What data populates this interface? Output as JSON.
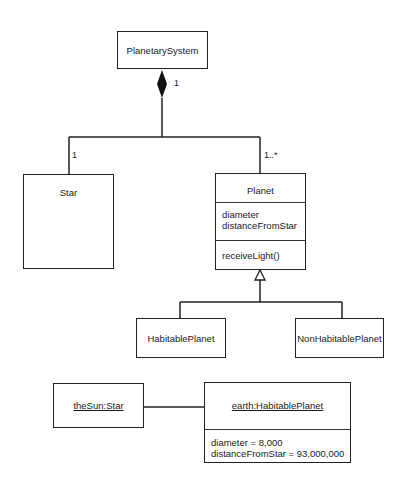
{
  "class_diagram": {
    "planetary_system": {
      "name": "PlanetarySystem"
    },
    "composition": {
      "whole_multiplicity": "1",
      "star_multiplicity": "1",
      "planet_multiplicity": "1..*"
    },
    "star": {
      "name": "Star"
    },
    "planet": {
      "name": "Planet",
      "attributes": [
        "diameter",
        "distanceFromStar"
      ],
      "operations": [
        "receiveLight()"
      ]
    },
    "habitable_planet": {
      "name": "HabitablePlanet"
    },
    "non_habitable_planet": {
      "name": "NonHabitablePlanet"
    }
  },
  "object_diagram": {
    "the_sun": {
      "name": "theSun:Star"
    },
    "earth": {
      "name": "earth:HabitablePlanet",
      "attributes": [
        "diameter = 8,000",
        "distanceFromStar = 93,000,000"
      ]
    }
  }
}
